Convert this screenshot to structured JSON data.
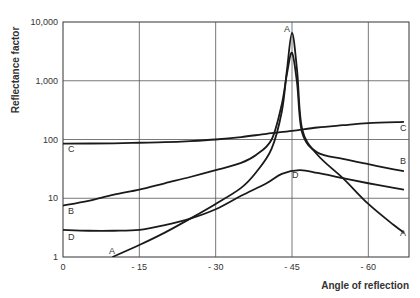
{
  "chart_data": {
    "type": "line",
    "title": "",
    "xlabel": "Angle of reflection",
    "ylabel": "Reflectance factor",
    "xlim": [
      0,
      -67
    ],
    "ylim": [
      1,
      10000
    ],
    "yscale": "log",
    "grid": true,
    "x_ticks": [
      "0",
      "- 15",
      "- 30",
      "- 45",
      "- 60"
    ],
    "x_tick_values": [
      0,
      -15,
      -30,
      -45,
      -60
    ],
    "y_ticks": [
      "1",
      "10",
      "100",
      "1,000",
      "10,000"
    ],
    "y_tick_values": [
      1,
      10,
      100,
      1000,
      10000
    ],
    "series": [
      {
        "name": "A",
        "points": [
          [
            -9.7,
            1
          ],
          [
            -15,
            1.6
          ],
          [
            -20,
            2.6
          ],
          [
            -25,
            4.5
          ],
          [
            -30,
            8
          ],
          [
            -35,
            15
          ],
          [
            -38,
            28
          ],
          [
            -41,
            70
          ],
          [
            -43,
            300
          ],
          [
            -44,
            1500
          ],
          [
            -45,
            6500
          ],
          [
            -46,
            1500
          ],
          [
            -47,
            150
          ],
          [
            -50,
            55
          ],
          [
            -55,
            22
          ],
          [
            -60,
            8
          ],
          [
            -65,
            3.5
          ],
          [
            -67,
            2.6
          ]
        ]
      },
      {
        "name": "B",
        "points": [
          [
            0,
            7.5
          ],
          [
            -5,
            9
          ],
          [
            -10,
            11.5
          ],
          [
            -15,
            14
          ],
          [
            -20,
            18
          ],
          [
            -25,
            23
          ],
          [
            -30,
            30
          ],
          [
            -35,
            40
          ],
          [
            -38,
            55
          ],
          [
            -41,
            100
          ],
          [
            -43,
            400
          ],
          [
            -44,
            1300
          ],
          [
            -45,
            3000
          ],
          [
            -46,
            900
          ],
          [
            -47,
            130
          ],
          [
            -50,
            60
          ],
          [
            -55,
            47
          ],
          [
            -60,
            38
          ],
          [
            -65,
            31
          ],
          [
            -67,
            29
          ]
        ]
      },
      {
        "name": "C",
        "points": [
          [
            0,
            85
          ],
          [
            -10,
            86
          ],
          [
            -15,
            88
          ],
          [
            -20,
            90
          ],
          [
            -25,
            94
          ],
          [
            -30,
            100
          ],
          [
            -35,
            110
          ],
          [
            -40,
            125
          ],
          [
            -45,
            140
          ],
          [
            -50,
            160
          ],
          [
            -55,
            175
          ],
          [
            -60,
            190
          ],
          [
            -67,
            200
          ]
        ]
      },
      {
        "name": "D",
        "points": [
          [
            0,
            2.9
          ],
          [
            -5,
            2.8
          ],
          [
            -10,
            2.8
          ],
          [
            -15,
            2.9
          ],
          [
            -20,
            3.5
          ],
          [
            -25,
            4.5
          ],
          [
            -30,
            6.5
          ],
          [
            -35,
            11
          ],
          [
            -40,
            18
          ],
          [
            -43,
            26
          ],
          [
            -46.5,
            30
          ],
          [
            -50,
            27
          ],
          [
            -55,
            22
          ],
          [
            -60,
            18
          ],
          [
            -65,
            15
          ],
          [
            -67,
            14
          ]
        ]
      }
    ],
    "annotations": [
      {
        "text": "A",
        "near": "peak",
        "x": -44,
        "y": 7000
      },
      {
        "text": "A",
        "near": "bottom-left",
        "x": -8.5,
        "y": 1.2
      },
      {
        "text": "A",
        "near": "right",
        "x": -66,
        "y": 1.7
      },
      {
        "text": "B",
        "near": "left",
        "x": 1,
        "y": 5
      },
      {
        "text": "B",
        "near": "right",
        "x": -66,
        "y": 40
      },
      {
        "text": "C",
        "near": "left",
        "x": 1,
        "y": 65
      },
      {
        "text": "C",
        "near": "right",
        "x": -66,
        "y": 170
      },
      {
        "text": "D",
        "near": "left",
        "x": 1,
        "y": 2
      },
      {
        "text": "D",
        "near": "middle",
        "x": -46,
        "y": 23
      }
    ]
  }
}
